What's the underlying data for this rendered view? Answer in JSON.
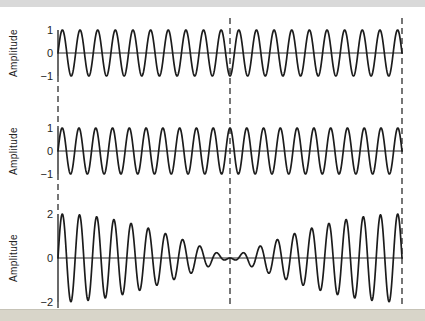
{
  "colors": {
    "ink": "#1c1c1c",
    "axis": "#2a2a2a",
    "guide": "#3c3c3c",
    "background": "#ffffff",
    "top_strip": "#d9d9d9",
    "bottom_band": "#d8d5c9"
  },
  "chart_data": {
    "type": "line",
    "layout_hint": "three vertically stacked panels sharing one horizontal time axis; dashed vertical guides at start, middle and end of the axis; no grid; no legend",
    "guides": {
      "style": "dashed",
      "x_frac": [
        0,
        0.5,
        1
      ]
    },
    "panels": [
      {
        "ylabel": "Amplitude",
        "yticks": [
          "1",
          "0",
          "−1"
        ],
        "ylim": [
          -1,
          1
        ],
        "grid": false,
        "series": [
          {
            "name": "wave-1",
            "kind": "sine",
            "cycles": 19.5,
            "amplitude": 1,
            "phase": 0,
            "value_at_center_guide": -1
          }
        ]
      },
      {
        "ylabel": "Amplitude",
        "yticks": [
          "1",
          "0",
          "−1"
        ],
        "ylim": [
          -1,
          1
        ],
        "grid": false,
        "series": [
          {
            "name": "wave-2",
            "kind": "sine",
            "cycles": 20.5,
            "amplitude": 1,
            "phase": 0,
            "value_at_center_guide": 1
          }
        ]
      },
      {
        "ylabel": "Amplitude",
        "yticks": [
          "2",
          "0",
          "−2"
        ],
        "ylim": [
          -2,
          2
        ],
        "grid": false,
        "series": [
          {
            "name": "superposition",
            "kind": "beat",
            "cycles_a": 19.5,
            "cycles_b": 20.5,
            "component_amplitude": 1,
            "carrier_cycles": 20,
            "envelope_peak": 2,
            "envelope_zero_frac": 0.5
          }
        ]
      }
    ]
  }
}
